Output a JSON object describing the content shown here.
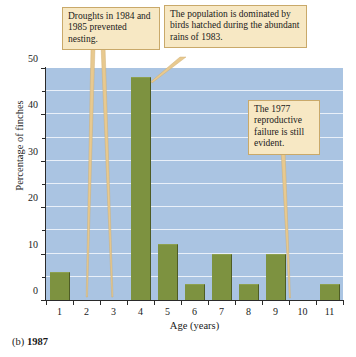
{
  "chart_data": {
    "type": "bar",
    "title": "",
    "xlabel": "Age (years)",
    "ylabel": "Percentage of finches",
    "categories": [
      "1",
      "2",
      "3",
      "4",
      "5",
      "6",
      "7",
      "8",
      "9",
      "10",
      "11"
    ],
    "values": [
      6,
      0,
      0,
      48,
      12,
      3.5,
      10,
      3.5,
      10,
      0,
      3.5
    ],
    "ylim": [
      0,
      50
    ],
    "yticks": [
      0,
      10,
      20,
      30,
      40,
      50
    ],
    "ytick_labels": [
      "0",
      "10",
      "20",
      "30",
      "40",
      "50"
    ],
    "yminor_ticks": [
      5,
      15,
      25,
      35,
      45
    ],
    "grid": true,
    "gridlines_at": [
      5,
      10,
      15,
      20,
      25,
      30,
      35,
      40,
      45
    ],
    "legend": "none",
    "bar_color": "#7d9240",
    "plot_background": "#aac4e2",
    "gridline_color": "#e9f0f9",
    "annotations": [
      {
        "id": "droughts",
        "text": "Droughts in 1984 and 1985 prevented nesting.",
        "points_to": [
          "2",
          "3"
        ]
      },
      {
        "id": "population",
        "text": "The population is dominated by birds hatched during the abundant rains of 1983.",
        "points_to": [
          "4"
        ]
      },
      {
        "id": "failure",
        "text": "The 1977 reproductive failure is still evident.",
        "points_to": [
          "10"
        ]
      }
    ]
  },
  "caption": {
    "label": "(b)",
    "year": "1987"
  },
  "callout_style": {
    "background": "#f7e8c4",
    "border": "#c9a96a"
  }
}
